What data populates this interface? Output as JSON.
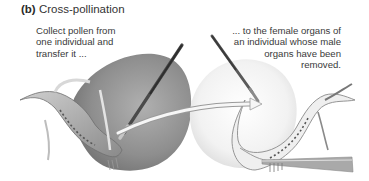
{
  "figure": {
    "label": "(b)",
    "title": "Cross-pollination",
    "steps": [
      {
        "lines": [
          "Collect pollen from",
          "one individual and",
          "transfer it ..."
        ]
      },
      {
        "lines": [
          "... to the female organs of",
          "an individual whose male",
          "organs have been",
          "removed."
        ]
      }
    ],
    "colors": {
      "flower_dark": "#8a8a8a",
      "flower_light": "#ececec",
      "arrow": "#f4f4f4",
      "text": "#333333"
    }
  }
}
